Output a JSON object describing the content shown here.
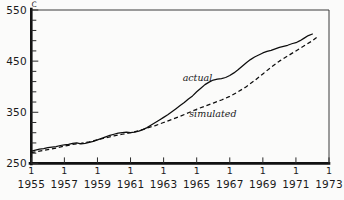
{
  "chart_data": {
    "type": "line",
    "title": "",
    "subtitle": "",
    "xlabel": "",
    "ylabel": "C",
    "ylim": [
      250,
      550
    ],
    "xlim": [
      1955,
      1973
    ],
    "grid": false,
    "legend_position": "inline-annotation",
    "y_ticks_major": [
      "550",
      "450",
      "350",
      "250"
    ],
    "y_tick_values_major": [
      550,
      450,
      350,
      250
    ],
    "y_minor_tick_interval": 20,
    "x_tick_labels": [
      "1955",
      "1957",
      "1959",
      "1961",
      "1963",
      "1965",
      "1967",
      "1969",
      "1971",
      "1973"
    ],
    "x_tick_values": [
      1955,
      1957,
      1959,
      1961,
      1963,
      1965,
      1967,
      1969,
      1971,
      1973
    ],
    "x_tick_mark_glyph": "1",
    "annotations": [
      {
        "text": "actual",
        "x": 1964.15,
        "y": 412
      },
      {
        "text": "simulated",
        "x": 1964.55,
        "y": 341
      }
    ],
    "series": [
      {
        "name": "actual",
        "style": "solid",
        "color": "#0d0d0d",
        "x": [
          1955.0,
          1955.25,
          1955.5,
          1955.75,
          1956.0,
          1956.25,
          1956.5,
          1956.75,
          1957.0,
          1957.25,
          1957.5,
          1957.75,
          1958.0,
          1958.25,
          1958.5,
          1958.75,
          1959.0,
          1959.25,
          1959.5,
          1959.75,
          1960.0,
          1960.25,
          1960.5,
          1960.75,
          1961.0,
          1961.25,
          1961.5,
          1961.75,
          1962.0,
          1962.25,
          1962.5,
          1962.75,
          1963.0,
          1963.25,
          1963.5,
          1963.75,
          1964.0,
          1964.25,
          1964.5,
          1964.75,
          1965.0,
          1965.25,
          1965.5,
          1965.75,
          1966.0,
          1966.25,
          1966.5,
          1966.75,
          1967.0,
          1967.25,
          1967.5,
          1967.75,
          1968.0,
          1968.25,
          1968.5,
          1968.75,
          1969.0,
          1969.25,
          1969.5,
          1969.75,
          1970.0,
          1970.25,
          1970.5,
          1970.75,
          1971.0,
          1971.25,
          1971.5,
          1971.75,
          1972.0
        ],
        "y": [
          274,
          276,
          278,
          279,
          281,
          282,
          283,
          285,
          286,
          287,
          289,
          290,
          288,
          289,
          291,
          293,
          296,
          299,
          302,
          305,
          307,
          309,
          310,
          311,
          310,
          311,
          313,
          316,
          320,
          325,
          330,
          335,
          340,
          345,
          351,
          357,
          363,
          369,
          376,
          382,
          390,
          397,
          404,
          409,
          413,
          415,
          416,
          418,
          422,
          427,
          433,
          440,
          447,
          453,
          458,
          462,
          466,
          469,
          471,
          474,
          477,
          479,
          481,
          484,
          486,
          490,
          495,
          500,
          503
        ]
      },
      {
        "name": "simulated",
        "style": "dashed",
        "color": "#0d0d0d",
        "x": [
          1955.0,
          1955.5,
          1956.0,
          1956.5,
          1957.0,
          1957.5,
          1958.0,
          1958.5,
          1959.0,
          1959.5,
          1960.0,
          1960.5,
          1961.0,
          1961.5,
          1962.0,
          1962.5,
          1963.0,
          1963.5,
          1964.0,
          1964.5,
          1965.0,
          1965.5,
          1966.0,
          1966.5,
          1967.0,
          1967.5,
          1968.0,
          1968.5,
          1969.0,
          1969.5,
          1970.0,
          1970.5,
          1971.0,
          1971.5,
          1972.0,
          1972.25
        ],
        "y": [
          271,
          274,
          277,
          280,
          284,
          287,
          289,
          292,
          296,
          300,
          304,
          307,
          310,
          314,
          319,
          324,
          330,
          336,
          342,
          349,
          356,
          362,
          368,
          374,
          381,
          390,
          400,
          412,
          425,
          438,
          450,
          460,
          470,
          480,
          490,
          496
        ]
      }
    ]
  },
  "figure": {
    "background": "#fbfbfa",
    "axis_color": "#111111",
    "frame_color": "#3a3a3a"
  }
}
